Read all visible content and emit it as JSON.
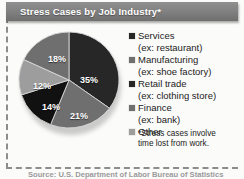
{
  "title": "Stress Cases by Job Industry*",
  "footnote": {
    "line1": "*Stress cases involve",
    "line2": "time lost from work."
  },
  "source": "Source: U.S. Department of Labor Bureau of Statistics",
  "colors": {
    "dark": "#272727",
    "black": "#111111",
    "medium": "#6f6f6f",
    "light": "#9d9d9d",
    "title_bar": "#828282",
    "frame": "#8d8d8d"
  },
  "legend": [
    {
      "label": "Services",
      "example": "(ex: restaurant)",
      "swatch": "#272727"
    },
    {
      "label": "Manufacturing",
      "example": "(ex: shoe factory)",
      "swatch": "#6f6f6f"
    },
    {
      "label": "Retail trade",
      "example": "(ex: clothing store)",
      "swatch": "#272727"
    },
    {
      "label": "Finance",
      "example": "(ex: bank)",
      "swatch": "#6f6f6f"
    },
    {
      "label": "Other",
      "example": "",
      "swatch": "#9d9d9d"
    }
  ],
  "chart_data": {
    "type": "pie",
    "title": "Stress Cases by Job Industry*",
    "categories": [
      "Services",
      "Retail trade",
      "Finance",
      "Other",
      "Manufacturing"
    ],
    "values": [
      35,
      21,
      14,
      12,
      18
    ],
    "labels": [
      "35%",
      "21%",
      "14%",
      "12%",
      "18%"
    ],
    "unit": "percent",
    "start_angle_deg": 0,
    "direction": "clockwise",
    "slice_colors": [
      "#272727",
      "#6f6f6f",
      "#111111",
      "#9d9d9d",
      "#6f6f6f"
    ],
    "legend_position": "right",
    "grid": false
  }
}
